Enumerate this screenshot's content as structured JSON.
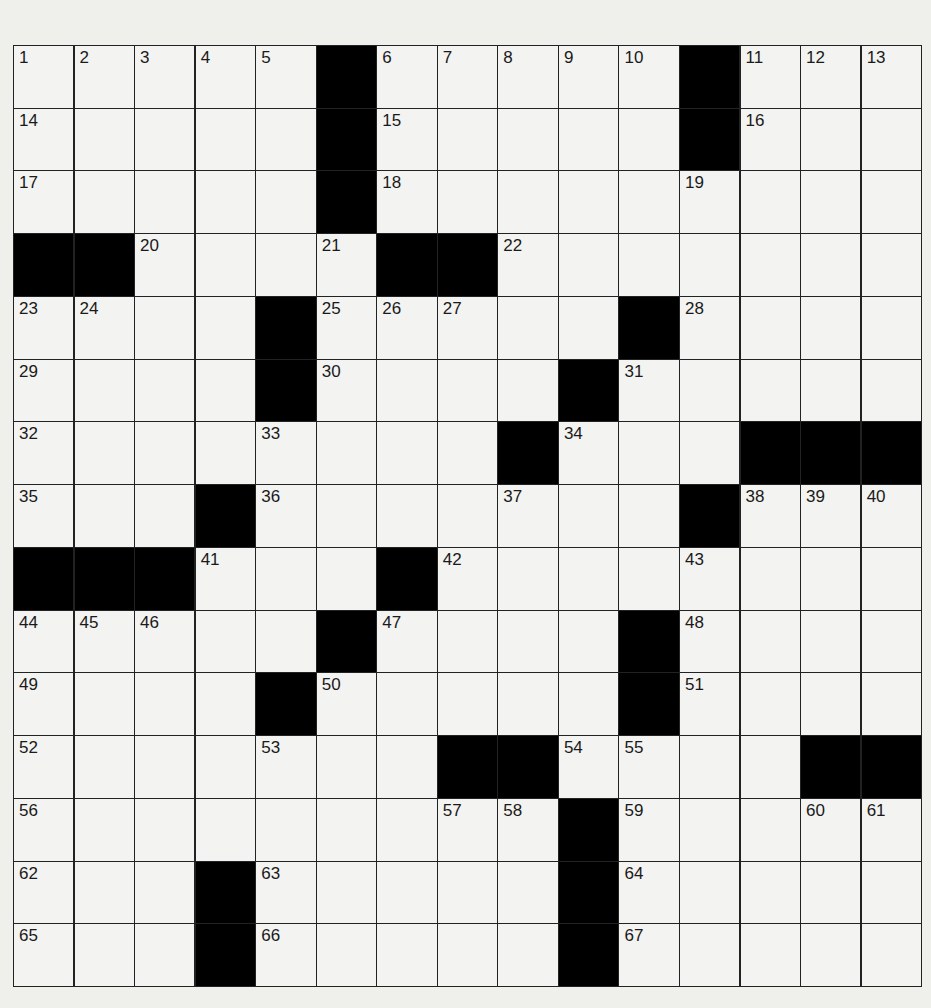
{
  "puzzle": {
    "rows": 15,
    "cols": 15,
    "colors": {
      "black": "#000000",
      "white": "#f3f3f1",
      "line": "#222222",
      "paper": "#efefec"
    },
    "black_cells": [
      [
        0,
        5
      ],
      [
        0,
        11
      ],
      [
        1,
        5
      ],
      [
        1,
        11
      ],
      [
        2,
        5
      ],
      [
        3,
        0
      ],
      [
        3,
        1
      ],
      [
        3,
        6
      ],
      [
        3,
        7
      ],
      [
        4,
        4
      ],
      [
        4,
        10
      ],
      [
        5,
        4
      ],
      [
        5,
        9
      ],
      [
        6,
        8
      ],
      [
        6,
        12
      ],
      [
        6,
        13
      ],
      [
        6,
        14
      ],
      [
        7,
        3
      ],
      [
        7,
        11
      ],
      [
        8,
        0
      ],
      [
        8,
        1
      ],
      [
        8,
        2
      ],
      [
        8,
        6
      ],
      [
        9,
        5
      ],
      [
        9,
        10
      ],
      [
        10,
        4
      ],
      [
        10,
        10
      ],
      [
        11,
        7
      ],
      [
        11,
        8
      ],
      [
        11,
        13
      ],
      [
        11,
        14
      ],
      [
        12,
        9
      ],
      [
        13,
        3
      ],
      [
        13,
        9
      ],
      [
        14,
        3
      ],
      [
        14,
        9
      ]
    ],
    "numbers": [
      {
        "r": 0,
        "c": 0,
        "n": "1"
      },
      {
        "r": 0,
        "c": 1,
        "n": "2"
      },
      {
        "r": 0,
        "c": 2,
        "n": "3"
      },
      {
        "r": 0,
        "c": 3,
        "n": "4"
      },
      {
        "r": 0,
        "c": 4,
        "n": "5"
      },
      {
        "r": 0,
        "c": 6,
        "n": "6"
      },
      {
        "r": 0,
        "c": 7,
        "n": "7"
      },
      {
        "r": 0,
        "c": 8,
        "n": "8"
      },
      {
        "r": 0,
        "c": 9,
        "n": "9"
      },
      {
        "r": 0,
        "c": 10,
        "n": "10"
      },
      {
        "r": 0,
        "c": 12,
        "n": "11"
      },
      {
        "r": 0,
        "c": 13,
        "n": "12"
      },
      {
        "r": 0,
        "c": 14,
        "n": "13"
      },
      {
        "r": 1,
        "c": 0,
        "n": "14"
      },
      {
        "r": 1,
        "c": 6,
        "n": "15"
      },
      {
        "r": 1,
        "c": 12,
        "n": "16"
      },
      {
        "r": 2,
        "c": 0,
        "n": "17"
      },
      {
        "r": 2,
        "c": 6,
        "n": "18"
      },
      {
        "r": 2,
        "c": 11,
        "n": "19"
      },
      {
        "r": 3,
        "c": 2,
        "n": "20"
      },
      {
        "r": 3,
        "c": 5,
        "n": "21"
      },
      {
        "r": 3,
        "c": 8,
        "n": "22"
      },
      {
        "r": 4,
        "c": 0,
        "n": "23"
      },
      {
        "r": 4,
        "c": 1,
        "n": "24"
      },
      {
        "r": 4,
        "c": 5,
        "n": "25"
      },
      {
        "r": 4,
        "c": 6,
        "n": "26"
      },
      {
        "r": 4,
        "c": 7,
        "n": "27"
      },
      {
        "r": 4,
        "c": 11,
        "n": "28"
      },
      {
        "r": 5,
        "c": 0,
        "n": "29"
      },
      {
        "r": 5,
        "c": 5,
        "n": "30"
      },
      {
        "r": 5,
        "c": 10,
        "n": "31"
      },
      {
        "r": 6,
        "c": 0,
        "n": "32"
      },
      {
        "r": 6,
        "c": 4,
        "n": "33"
      },
      {
        "r": 6,
        "c": 9,
        "n": "34"
      },
      {
        "r": 7,
        "c": 0,
        "n": "35"
      },
      {
        "r": 7,
        "c": 4,
        "n": "36"
      },
      {
        "r": 7,
        "c": 8,
        "n": "37"
      },
      {
        "r": 7,
        "c": 12,
        "n": "38"
      },
      {
        "r": 7,
        "c": 13,
        "n": "39"
      },
      {
        "r": 7,
        "c": 14,
        "n": "40"
      },
      {
        "r": 8,
        "c": 3,
        "n": "41"
      },
      {
        "r": 8,
        "c": 7,
        "n": "42"
      },
      {
        "r": 8,
        "c": 11,
        "n": "43"
      },
      {
        "r": 9,
        "c": 0,
        "n": "44"
      },
      {
        "r": 9,
        "c": 1,
        "n": "45"
      },
      {
        "r": 9,
        "c": 2,
        "n": "46"
      },
      {
        "r": 9,
        "c": 6,
        "n": "47"
      },
      {
        "r": 9,
        "c": 11,
        "n": "48"
      },
      {
        "r": 10,
        "c": 0,
        "n": "49"
      },
      {
        "r": 10,
        "c": 5,
        "n": "50"
      },
      {
        "r": 10,
        "c": 11,
        "n": "51"
      },
      {
        "r": 11,
        "c": 0,
        "n": "52"
      },
      {
        "r": 11,
        "c": 4,
        "n": "53"
      },
      {
        "r": 11,
        "c": 9,
        "n": "54"
      },
      {
        "r": 11,
        "c": 10,
        "n": "55"
      },
      {
        "r": 12,
        "c": 0,
        "n": "56"
      },
      {
        "r": 12,
        "c": 7,
        "n": "57"
      },
      {
        "r": 12,
        "c": 8,
        "n": "58"
      },
      {
        "r": 12,
        "c": 10,
        "n": "59"
      },
      {
        "r": 12,
        "c": 13,
        "n": "60"
      },
      {
        "r": 12,
        "c": 14,
        "n": "61"
      },
      {
        "r": 13,
        "c": 0,
        "n": "62"
      },
      {
        "r": 13,
        "c": 4,
        "n": "63"
      },
      {
        "r": 13,
        "c": 10,
        "n": "64"
      },
      {
        "r": 14,
        "c": 0,
        "n": "65"
      },
      {
        "r": 14,
        "c": 4,
        "n": "66"
      },
      {
        "r": 14,
        "c": 10,
        "n": "67"
      }
    ],
    "letters": []
  }
}
